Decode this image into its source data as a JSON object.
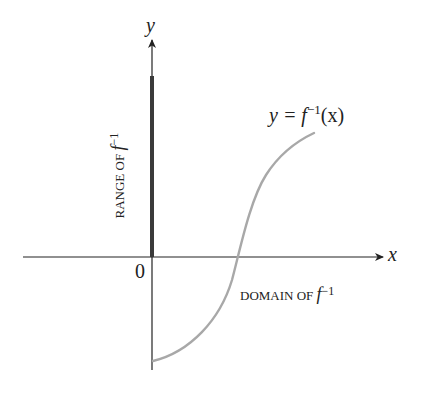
{
  "diagram": {
    "axes": {
      "x_label": "x",
      "y_label": "y",
      "origin_label": "0"
    },
    "curve": {
      "label_prefix": "y = f",
      "label_superscript": "−1",
      "label_suffix": "(x)",
      "color": "#a8a8a8"
    },
    "range_label": {
      "text": "RANGE OF ",
      "func": "f",
      "superscript": "−1"
    },
    "domain_label": {
      "text": "DOMAIN OF ",
      "func": "f",
      "superscript": "−1"
    },
    "colors": {
      "axis": "#222222",
      "highlight_bar": "#3a3a3a",
      "curve": "#a8a8a8",
      "text": "#222222"
    }
  }
}
